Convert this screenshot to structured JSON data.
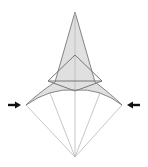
{
  "diagram": {
    "title": "",
    "colors": {
      "fill_shaded": "#e0e0e0",
      "line_dark": "#777777",
      "line_light": "#b8b8b8",
      "arrow": "#111111",
      "background": "#ffffff"
    },
    "shaded_region": "M75,12 L95,82 Q112,95 122,105 Q100,88 75,90 Q50,88 26,105 Q36,95 55,82 Z",
    "inner_triangle": [
      [
        75,
        55
      ],
      [
        48,
        81
      ],
      [
        102,
        81
      ]
    ],
    "horizontal_crease": [
      [
        48,
        81
      ],
      [
        102,
        81
      ]
    ],
    "v_crease": [
      [
        48,
        81
      ],
      [
        75,
        91
      ],
      [
        102,
        81
      ]
    ],
    "center_line": [
      [
        75,
        12
      ],
      [
        75,
        157
      ]
    ],
    "tip": [
      75,
      12
    ],
    "bottom_point": [
      75,
      157
    ],
    "left_corner": [
      26,
      105
    ],
    "right_corner": [
      122,
      105
    ],
    "lower_lines": [
      [
        [
          26,
          105
        ],
        [
          75,
          157
        ]
      ],
      [
        [
          122,
          105
        ],
        [
          75,
          157
        ]
      ],
      [
        [
          50,
          93
        ],
        [
          75,
          157
        ]
      ],
      [
        [
          100,
          93
        ],
        [
          75,
          157
        ]
      ]
    ],
    "arrows": [
      {
        "name": "left-push-arrow",
        "x": 8,
        "y": 105,
        "direction": "right"
      },
      {
        "name": "right-push-arrow",
        "x": 140,
        "y": 105,
        "direction": "left"
      }
    ]
  }
}
